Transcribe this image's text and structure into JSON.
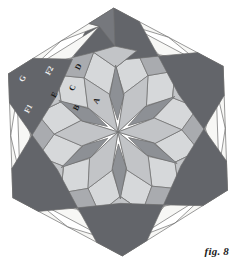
{
  "figure": {
    "caption": "fig. 8",
    "shape": "hexagon",
    "symmetry": "6-fold rosette tiling",
    "center": {
      "x": 118,
      "y": 132
    },
    "radius": 124
  },
  "palette": {
    "background": "#ffffff",
    "outline": "#6f6f6f",
    "dark_gray": "#63656a",
    "mid_dark_gray": "#76787d",
    "mid_gray": "#8d9095",
    "light_mid_gray": "#a9abaf",
    "light_gray": "#c2c4c7",
    "pale_gray": "#d6d8da",
    "white": "#f7f7f5",
    "label_dark": "#1a1a1a",
    "label_light": "#f2f2f2"
  },
  "labels": [
    {
      "id": "A",
      "text": "A",
      "x": 97,
      "y": 101,
      "rotation": -62,
      "tone": "dark"
    },
    {
      "id": "B",
      "text": "B",
      "x": 77,
      "y": 108,
      "rotation": -62,
      "tone": "dark"
    },
    {
      "id": "C",
      "text": "C",
      "x": 73,
      "y": 88,
      "rotation": -62,
      "tone": "dark"
    },
    {
      "id": "D",
      "text": "D",
      "x": 79,
      "y": 67,
      "rotation": -62,
      "tone": "dark"
    },
    {
      "id": "E",
      "text": "E",
      "x": 55,
      "y": 95,
      "rotation": -62,
      "tone": "dark"
    },
    {
      "id": "F1",
      "text": "F1",
      "x": 29,
      "y": 109,
      "rotation": -62,
      "tone": "light"
    },
    {
      "id": "F2",
      "text": "F2",
      "x": 50,
      "y": 71,
      "rotation": -62,
      "tone": "light"
    },
    {
      "id": "G",
      "text": "G",
      "x": 23,
      "y": 79,
      "rotation": -62,
      "tone": "light"
    }
  ],
  "tiles": {
    "note": "Hexagonal rosette composed of 6 repeated sectors of rhombi, kites and triangles.",
    "sector_count": 6,
    "ring_names": [
      "center-petals",
      "inner-rhombi",
      "mid-kites",
      "mid-squares",
      "outer-triangles",
      "border-rhombi",
      "corner-hexagons"
    ]
  }
}
